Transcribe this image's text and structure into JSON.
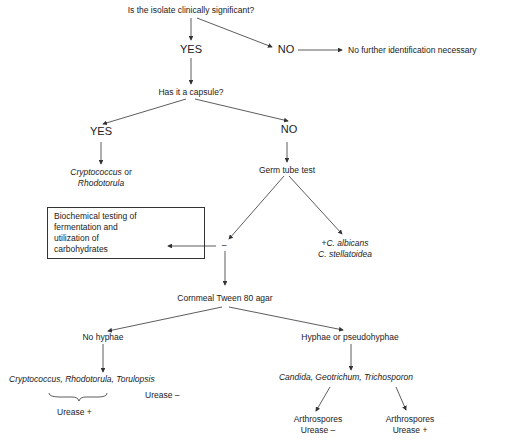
{
  "nodes": {
    "q1": "Is the isolate clinically significant?",
    "yes1": "YES",
    "no1": "NO",
    "no_further": "No further identification necessary",
    "q2": "Has it a capsule?",
    "yes2": "YES",
    "no2": "NO",
    "crypto_rhodo_1": "Cryptococcus",
    "or": " or",
    "rhodo_1": "Rhodotorula",
    "germ_tube": "Germ tube test",
    "biochem": [
      "Biochemical testing of",
      "fermentation and",
      "utilization of",
      "carbohydrates"
    ],
    "minus": "–",
    "plus_prefix": "+",
    "c_albicans": "C. albicans",
    "c_stellatoidea": "C. stellatoidea",
    "cornmeal": "Cornmeal Tween 80 agar",
    "no_hyphae": "No hyphae",
    "hyphae": "Hyphae or pseudohyphae",
    "genera_left": "Cryptococcus, Rhodotorula, Torulopsis",
    "urease_minus_left": "Urease –",
    "urease_plus_left": "Urease +",
    "genera_right": "Candida, Geotrichum, Trichosporon",
    "arthro1": "Arthrospores",
    "arthro1_urease": "Urease –",
    "arthro2": "Arthrospores",
    "arthro2_urease": "Urease +"
  }
}
